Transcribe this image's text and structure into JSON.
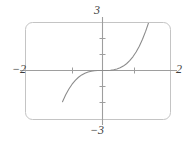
{
  "figure": {
    "name": "cubic-function-graph",
    "width": 194,
    "height": 142,
    "background_color": "#ffffff"
  },
  "labels": {
    "top": "3",
    "bottom": "−3",
    "left": "−2",
    "right": "2"
  },
  "style": {
    "frame_color": "#bdbdbd",
    "axis_color": "#9b9b9b",
    "curve_color": "#8c8c8c",
    "text_color": "#3c3c3c"
  },
  "chart_data": {
    "type": "line",
    "title": "",
    "xlabel": "",
    "ylabel": "",
    "xlim": [
      -2,
      2
    ],
    "ylim": [
      -3,
      3
    ],
    "grid": false,
    "legend": null,
    "x_tick_labels": [
      "−2",
      "2"
    ],
    "y_tick_labels": [
      "3",
      "−3"
    ],
    "x_ticks": [
      -1,
      1
    ],
    "y_ticks": [
      -2,
      -1,
      1,
      2
    ],
    "series": [
      {
        "name": "y = x³",
        "color": "#8c8c8c",
        "x": [
          -1.25,
          -1.15,
          -1.05,
          -0.95,
          -0.85,
          -0.75,
          -0.65,
          -0.55,
          -0.45,
          -0.35,
          -0.25,
          -0.15,
          -0.05,
          0.05,
          0.15,
          0.25,
          0.35,
          0.45,
          0.55,
          0.65,
          0.75,
          0.85,
          0.95,
          1.05,
          1.15,
          1.25,
          1.35,
          1.44
        ],
        "y": [
          -1.953,
          -1.521,
          -1.158,
          -0.857,
          -0.614,
          -0.422,
          -0.275,
          -0.166,
          -0.091,
          -0.043,
          -0.016,
          -0.003,
          0.0,
          0.0,
          0.003,
          0.016,
          0.043,
          0.091,
          0.166,
          0.275,
          0.422,
          0.614,
          0.857,
          1.158,
          1.521,
          1.953,
          2.46,
          2.986
        ]
      }
    ],
    "annotations": []
  }
}
